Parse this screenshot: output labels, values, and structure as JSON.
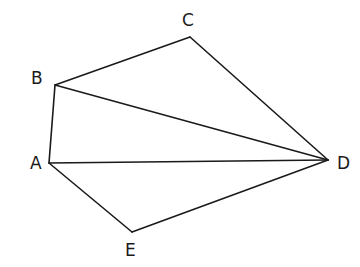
{
  "diagram": {
    "type": "geometry-figure",
    "vertices": [
      {
        "name": "A",
        "x": 49,
        "y": 163,
        "label_x": 30,
        "label_y": 169
      },
      {
        "name": "B",
        "x": 55,
        "y": 85,
        "label_x": 31,
        "label_y": 84
      },
      {
        "name": "C",
        "x": 190,
        "y": 37,
        "label_x": 182,
        "label_y": 26
      },
      {
        "name": "D",
        "x": 328,
        "y": 160,
        "label_x": 337,
        "label_y": 169
      },
      {
        "name": "E",
        "x": 132,
        "y": 232,
        "label_x": 125,
        "label_y": 256
      }
    ],
    "edges": [
      {
        "from": "A",
        "to": "B"
      },
      {
        "from": "B",
        "to": "C"
      },
      {
        "from": "C",
        "to": "D"
      },
      {
        "from": "B",
        "to": "D"
      },
      {
        "from": "A",
        "to": "D"
      },
      {
        "from": "A",
        "to": "E"
      },
      {
        "from": "E",
        "to": "D"
      }
    ],
    "line_color": "#1a1a1a"
  }
}
